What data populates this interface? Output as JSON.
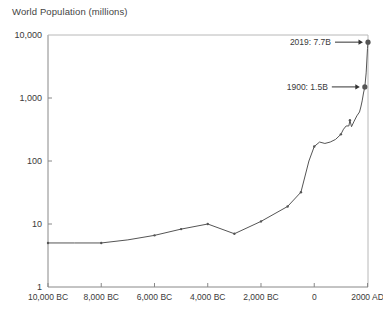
{
  "chart_data": {
    "type": "line",
    "title": "World Population (millions)",
    "xlabel": "",
    "ylabel": "World Population (millions)",
    "yscale": "log",
    "ylim": [
      1,
      10000
    ],
    "xlim": [
      -10000,
      2019
    ],
    "grid": false,
    "legend": null,
    "ytick_labels": [
      "1",
      "10",
      "100",
      "1,000",
      "10,000"
    ],
    "ytick_values": [
      1,
      10,
      100,
      1000,
      10000
    ],
    "xtick_labels": [
      "10,000 BC",
      "8,000 BC",
      "6,000 BC",
      "4,000 BC",
      "2,000 BC",
      "0",
      "2000 AD"
    ],
    "xtick_values": [
      -10000,
      -8000,
      -6000,
      -4000,
      -2000,
      0,
      2000
    ],
    "x": [
      -10000,
      -9000,
      -8000,
      -7000,
      -6000,
      -5000,
      -4000,
      -3000,
      -2000,
      -1000,
      -500,
      -200,
      0,
      200,
      400,
      600,
      800,
      1000,
      1100,
      1200,
      1300,
      1340,
      1400,
      1500,
      1600,
      1700,
      1750,
      1800,
      1850,
      1900,
      1950,
      2000,
      2019
    ],
    "y": [
      5,
      5,
      5,
      5.6,
      6.6,
      8.3,
      10,
      7,
      11,
      19,
      32,
      100,
      170,
      200,
      190,
      200,
      220,
      265,
      320,
      360,
      360,
      443,
      350,
      430,
      520,
      600,
      720,
      900,
      1200,
      1500,
      2500,
      6100,
      7700
    ],
    "markers": [
      {
        "x": -10000,
        "y": 5
      },
      {
        "x": -8000,
        "y": 5
      },
      {
        "x": -6000,
        "y": 6.6
      },
      {
        "x": -5000,
        "y": 8.3
      },
      {
        "x": -4000,
        "y": 10
      },
      {
        "x": -3000,
        "y": 7
      },
      {
        "x": -2000,
        "y": 11
      },
      {
        "x": -1000,
        "y": 19
      },
      {
        "x": -500,
        "y": 32
      },
      {
        "x": 0,
        "y": 170
      },
      {
        "x": 1000,
        "y": 265
      },
      {
        "x": 1340,
        "y": 443
      },
      {
        "x": 1900,
        "y": 1500
      },
      {
        "x": 2019,
        "y": 7700
      }
    ],
    "annotations": [
      {
        "label": "2019: 7.7B",
        "x": 2019,
        "y": 7700
      },
      {
        "label": "1900: 1.5B",
        "x": 1900,
        "y": 1500
      }
    ],
    "line_color": "#555555",
    "axis_color": "#888888",
    "text_color": "#3a3a3a"
  }
}
